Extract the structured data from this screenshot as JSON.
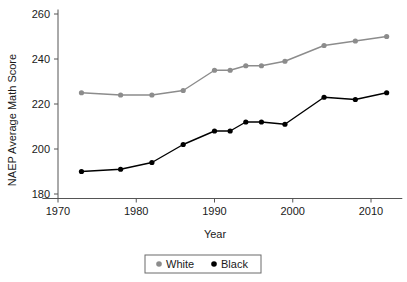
{
  "chart_data": {
    "type": "line",
    "title": "",
    "xlabel": "Year",
    "ylabel": "NAEP Average Math Score",
    "xlim": [
      1968,
      2014
    ],
    "ylim": [
      178,
      262
    ],
    "xticks": [
      1970,
      1980,
      1990,
      2000,
      2010
    ],
    "xtick_labels": [
      "1970",
      "1980",
      "1990",
      "2000",
      "2010"
    ],
    "yticks": [
      180,
      200,
      220,
      240,
      260
    ],
    "ytick_labels": [
      "180",
      "200",
      "220",
      "240",
      "260"
    ],
    "grid": false,
    "legend_position": "bottom-center",
    "x": [
      1973,
      1978,
      1982,
      1986,
      1990,
      1992,
      1994,
      1996,
      1999,
      2004,
      2008,
      2012
    ],
    "series": [
      {
        "name": "White",
        "color": "#8c8c8c",
        "marker": "circle",
        "values": [
          225,
          224,
          224,
          226,
          235,
          235,
          237,
          237,
          239,
          246,
          248,
          250
        ]
      },
      {
        "name": "Black",
        "color": "#000000",
        "marker": "circle",
        "values": [
          190,
          191,
          194,
          202,
          208,
          208,
          212,
          212,
          211,
          223,
          222,
          225
        ]
      }
    ],
    "legend": [
      {
        "label": "White",
        "color": "#8c8c8c"
      },
      {
        "label": "Black",
        "color": "#000000"
      }
    ]
  }
}
